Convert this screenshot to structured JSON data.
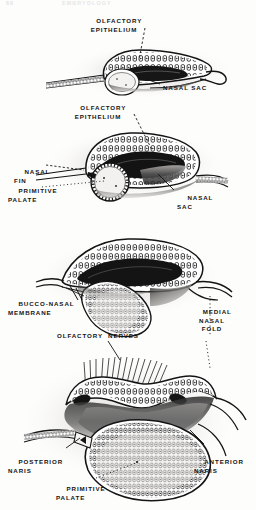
{
  "page": {
    "width": 256,
    "height": 510,
    "background_color": "#fdfdfc",
    "ink_color": "#141414",
    "running_head_left": "60",
    "running_head_right": "EMBRYOLOGY"
  },
  "figures": [
    {
      "id": "figure-1",
      "caption": "Early olfactory placode invagination forming the nasal sac",
      "labels": [
        {
          "id": "fig1-olfactory-epithelium",
          "text": "OLFACTORY\nEPITHELIUM",
          "x": 106,
          "y": 9,
          "align": "center",
          "leader": "dashed"
        },
        {
          "id": "fig1-nasal-sac",
          "text": "NASAL SAC",
          "x": 163,
          "y": 86,
          "align": "left",
          "leader": "solid"
        }
      ]
    },
    {
      "id": "figure-2",
      "caption": "Nasal fin and primitive palate stage",
      "labels": [
        {
          "id": "fig2-olfactory-epithelium",
          "text": "OLFACTORY\nEPITHELIUM",
          "x": 95,
          "y": 96,
          "align": "center",
          "leader": "dashed"
        },
        {
          "id": "fig2-nasal-fin",
          "text": "NASAL\nFIN",
          "x": 14,
          "y": 161,
          "align": "left",
          "leader": "dashed"
        },
        {
          "id": "fig2-primitive-palate",
          "text": "PRIMITIVE\nPALATE",
          "x": 12,
          "y": 180,
          "align": "left",
          "leader": "dotted"
        },
        {
          "id": "fig2-nasal-sac",
          "text": "NASAL\nSAC",
          "x": 177,
          "y": 186,
          "align": "left",
          "leader": "solid"
        }
      ]
    },
    {
      "id": "figure-3",
      "caption": "Bucco-nasal membrane and medial nasal fold",
      "labels": [
        {
          "id": "fig3-bucco-nasal-membrane",
          "text": "BUCCO-NASAL\nMEMBRANE",
          "x": 10,
          "y": 292,
          "align": "left",
          "leader": "solid"
        },
        {
          "id": "fig3-medial-nasal-fold",
          "text": "MEDIAL\nNASAL\nFOLD",
          "x": 196,
          "y": 301,
          "align": "left",
          "leader": "dotted"
        }
      ]
    },
    {
      "id": "figure-4",
      "caption": "Definitive nasal chamber with olfactory nerves, anterior and posterior naris",
      "labels": [
        {
          "id": "fig4-olfactory-nerves",
          "text": "OLFACTORY  NERVES",
          "x": 57,
          "y": 333,
          "align": "left",
          "leader": "solid"
        },
        {
          "id": "fig4-posterior-naris",
          "text": "POSTERIOR\nNARIS",
          "x": 10,
          "y": 451,
          "align": "left",
          "leader": "solid"
        },
        {
          "id": "fig4-primitive-palate",
          "text": "PRIMITIVE\nPALATE",
          "x": 58,
          "y": 478,
          "align": "left",
          "leader": "dotted"
        },
        {
          "id": "fig4-anterior-naris",
          "text": "ANTERIOR\nNARIS",
          "x": 196,
          "y": 451,
          "align": "left",
          "leader": "solid"
        }
      ]
    }
  ]
}
